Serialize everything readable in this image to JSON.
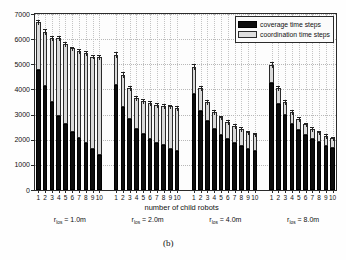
{
  "caption": "(b)",
  "legend": {
    "position": "top-right",
    "items": [
      {
        "label": "coverage time steps",
        "color": "#0d0d0d"
      },
      {
        "label": "coordination time steps",
        "color": "#d9d9d9"
      }
    ]
  },
  "axes": {
    "ylabel": "time steps",
    "xlabel": "number of child robots",
    "yticks": [
      0,
      1000,
      2000,
      3000,
      4000,
      5000,
      6000,
      7000
    ],
    "ylim": [
      0,
      7000
    ],
    "xticks": [
      "1",
      "2",
      "3",
      "4",
      "5",
      "6",
      "7",
      "8",
      "9",
      "10"
    ],
    "grid": "dotted"
  },
  "group_labels": [
    {
      "prefix": "r",
      "sub": "los",
      "value": "= 1.0m"
    },
    {
      "prefix": "r",
      "sub": "los",
      "value": "= 2.0m"
    },
    {
      "prefix": "r",
      "sub": "los",
      "value": "= 4.0m"
    },
    {
      "prefix": "r",
      "sub": "los",
      "value": "= 8.0m"
    }
  ],
  "chart_data": {
    "type": "bar",
    "subtype": "stacked-grouped",
    "title": "",
    "xlabel": "number of child robots",
    "ylabel": "time steps",
    "ylim": [
      0,
      7000
    ],
    "yticks": [
      0,
      1000,
      2000,
      3000,
      4000,
      5000,
      6000,
      7000
    ],
    "grid": true,
    "legend_position": "upper right",
    "categories": [
      "1",
      "2",
      "3",
      "4",
      "5",
      "6",
      "7",
      "8",
      "9",
      "10"
    ],
    "groups": [
      {
        "name": "r_los = 1.0m",
        "series": [
          {
            "name": "coverage time steps",
            "values": [
              4780,
              4120,
              3500,
              2950,
              2620,
              2300,
              2080,
              1870,
              1650,
              1400
            ]
          },
          {
            "name": "coordination time steps",
            "values": [
              1890,
              2180,
              2530,
              3110,
              3180,
              3330,
              3440,
              3580,
              3660,
              3900
            ]
          }
        ],
        "totals": [
          6670,
          6300,
          6030,
          6060,
          5800,
          5630,
          5520,
          5450,
          5310,
          5300
        ],
        "errors": [
          90,
          95,
          85,
          80,
          80,
          75,
          75,
          70,
          70,
          70
        ]
      },
      {
        "name": "r_los = 2.0m",
        "series": [
          {
            "name": "coverage time steps",
            "values": [
              4190,
              3310,
              2830,
              2420,
              2210,
              2010,
              1870,
              1780,
              1650,
              1570
            ]
          },
          {
            "name": "coordination time steps",
            "values": [
              1190,
              1270,
              1230,
              1250,
              1320,
              1450,
              1530,
              1570,
              1680,
              1700
            ]
          }
        ],
        "totals": [
          5380,
          4580,
          4060,
          3670,
          3530,
          3460,
          3400,
          3350,
          3330,
          3270
        ],
        "errors": [
          110,
          105,
          85,
          75,
          70,
          65,
          65,
          60,
          60,
          60
        ]
      },
      {
        "name": "r_los = 4.0m",
        "series": [
          {
            "name": "coverage time steps",
            "values": [
              3830,
              3130,
              2760,
              2420,
              2200,
              2010,
              1880,
              1750,
              1630,
              1550
            ]
          },
          {
            "name": "coordination time steps",
            "values": [
              1060,
              910,
              730,
              700,
              690,
              690,
              680,
              680,
              680,
              680
            ]
          }
        ],
        "totals": [
          4890,
          4040,
          3490,
          3120,
          2890,
          2700,
          2560,
          2430,
          2310,
          2230
        ],
        "errors": [
          115,
          95,
          80,
          75,
          70,
          65,
          60,
          60,
          55,
          55
        ]
      },
      {
        "name": "r_los = 8.0m",
        "series": [
          {
            "name": "coverage time steps",
            "values": [
              4250,
              3440,
              2980,
              2640,
              2400,
              2190,
              2020,
              1890,
              1760,
              1660
            ]
          },
          {
            "name": "coordination time steps",
            "values": [
              740,
              620,
              520,
              470,
              440,
              420,
              410,
              400,
              400,
              390
            ]
          }
        ],
        "totals": [
          4990,
          4060,
          3500,
          3110,
          2840,
          2610,
          2430,
          2290,
          2160,
          2050
        ],
        "errors": [
          120,
          95,
          80,
          75,
          70,
          65,
          60,
          55,
          55,
          50
        ]
      }
    ]
  }
}
